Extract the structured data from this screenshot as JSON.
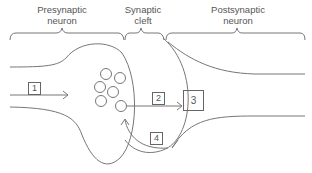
{
  "regions": {
    "presynaptic": {
      "line1": "Presynaptic",
      "line2": "neuron"
    },
    "cleft": {
      "line1": "Synaptic",
      "line2": "cleft"
    },
    "postsynaptic": {
      "line1": "Postsynaptic",
      "line2": "neuron"
    }
  },
  "steps": {
    "s1": "1",
    "s2": "2",
    "s3": "3",
    "s4": "4"
  },
  "vesicle_count": 6,
  "colors": {
    "stroke": "#777777",
    "text": "#555555",
    "background": "#ffffff"
  }
}
